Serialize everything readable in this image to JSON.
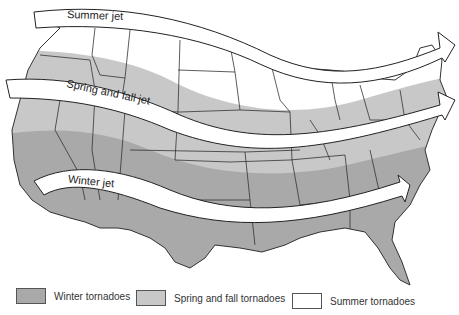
{
  "figure": {
    "jets": [
      {
        "label": "Summer jet"
      },
      {
        "label": "Spring and fall jet"
      },
      {
        "label": "Winter jet"
      }
    ],
    "legend": [
      {
        "label": "Winter tornadoes",
        "color": "#a9a9a9"
      },
      {
        "label": "Spring and fall tornadoes",
        "color": "#c8c8c8"
      },
      {
        "label": "Summer tornadoes",
        "color": "#ffffff"
      }
    ],
    "colors": {
      "winter_zone": "#a9a9a9",
      "spring_fall_zone": "#c8c8c8",
      "summer_zone": "#ffffff",
      "state_lines": "#333333",
      "jet_fill": "#ffffff",
      "jet_outline": "#222222"
    }
  }
}
